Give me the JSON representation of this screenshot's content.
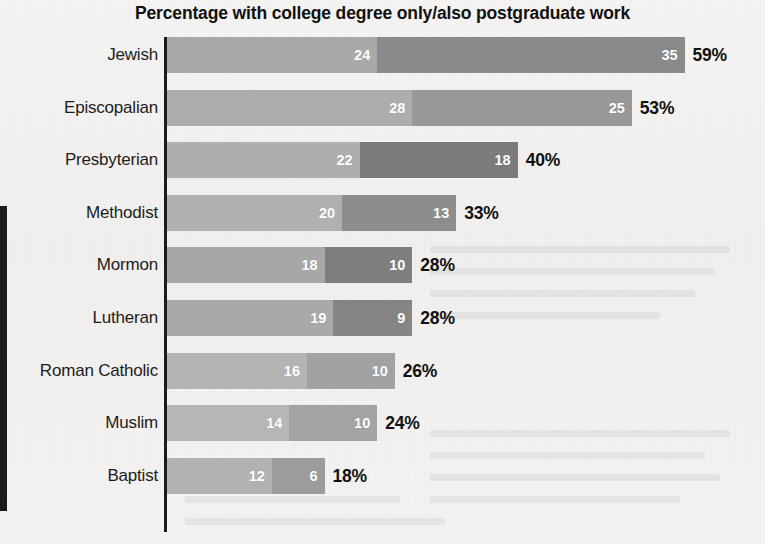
{
  "chart": {
    "title": "Percentage with college degree only/also postgraduate work"
  },
  "chart_data": {
    "type": "bar",
    "subtype": "stacked-horizontal",
    "title": "Percentage with college degree only/also postgraduate work",
    "xlabel": "",
    "ylabel": "",
    "xlim": [
      0,
      59
    ],
    "grid": false,
    "legend": "none",
    "categories": [
      "Jewish",
      "Episcopalian",
      "Presbyterian",
      "Methodist",
      "Mormon",
      "Lutheran",
      "Roman Catholic",
      "Muslim",
      "Baptist"
    ],
    "series": [
      {
        "name": "college degree only",
        "values": [
          24,
          28,
          22,
          20,
          18,
          19,
          16,
          14,
          12
        ]
      },
      {
        "name": "also postgraduate work",
        "values": [
          35,
          25,
          18,
          13,
          10,
          9,
          10,
          10,
          6
        ]
      }
    ],
    "totals": [
      59,
      53,
      40,
      33,
      28,
      28,
      26,
      24,
      18
    ],
    "total_labels": [
      "59%",
      "53%",
      "40%",
      "33%",
      "28%",
      "28%",
      "26%",
      "24%",
      "18%"
    ]
  },
  "rows": [
    {
      "label": "Jewish",
      "seg1_value": 24,
      "seg1_label": "24",
      "seg1_color": "#a9a9a9",
      "seg2_value": 35,
      "seg2_label": "35",
      "seg2_color": "#8a8a8a",
      "total_label": "59%"
    },
    {
      "label": "Episcopalian",
      "seg1_value": 28,
      "seg1_label": "28",
      "seg1_color": "#adadad",
      "seg2_value": 25,
      "seg2_label": "25",
      "seg2_color": "#989898",
      "total_label": "53%"
    },
    {
      "label": "Presbyterian",
      "seg1_value": 22,
      "seg1_label": "22",
      "seg1_color": "#aeaeae",
      "seg2_value": 18,
      "seg2_label": "18",
      "seg2_color": "#7b7b7b",
      "total_label": "40%"
    },
    {
      "label": "Methodist",
      "seg1_value": 20,
      "seg1_label": "20",
      "seg1_color": "#b0b0b0",
      "seg2_value": 13,
      "seg2_label": "13",
      "seg2_color": "#8d8d8d",
      "total_label": "33%"
    },
    {
      "label": "Mormon",
      "seg1_value": 18,
      "seg1_label": "18",
      "seg1_color": "#a7a7a7",
      "seg2_value": 10,
      "seg2_label": "10",
      "seg2_color": "#7e7e7e",
      "total_label": "28%"
    },
    {
      "label": "Lutheran",
      "seg1_value": 19,
      "seg1_label": "19",
      "seg1_color": "#a9a9a9",
      "seg2_value": 9,
      "seg2_label": "9",
      "seg2_color": "#858585",
      "total_label": "28%"
    },
    {
      "label": "Roman Catholic",
      "seg1_value": 16,
      "seg1_label": "16",
      "seg1_color": "#b4b4b4",
      "seg2_value": 10,
      "seg2_label": "10",
      "seg2_color": "#a2a2a2",
      "total_label": "26%"
    },
    {
      "label": "Muslim",
      "seg1_value": 14,
      "seg1_label": "14",
      "seg1_color": "#b6b6b6",
      "seg2_value": 10,
      "seg2_label": "10",
      "seg2_color": "#a3a3a3",
      "total_label": "24%"
    },
    {
      "label": "Baptist",
      "seg1_value": 12,
      "seg1_label": "12",
      "seg1_color": "#b2b2b2",
      "seg2_value": 6,
      "seg2_label": "6",
      "seg2_color": "#9c9c9c",
      "total_label": "18%"
    }
  ],
  "style": {
    "px_per_unit": 8.78,
    "row_height": 52.6,
    "bar_height": 36,
    "axis_color": "#1b1b1b",
    "page_background": "#f4f3f1",
    "title_color": "#111111",
    "label_color": "#1c1c1c"
  }
}
